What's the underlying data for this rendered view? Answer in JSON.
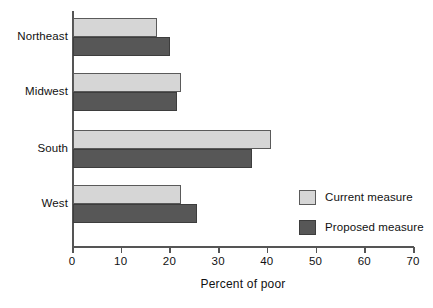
{
  "chart_data": {
    "type": "bar",
    "orientation": "horizontal",
    "title": "",
    "xlabel": "Percent of poor",
    "ylabel": "",
    "xlim": [
      0,
      70
    ],
    "xticks": [
      0,
      10,
      20,
      30,
      40,
      50,
      60,
      70
    ],
    "xtick_labels": [
      "0",
      "10",
      "20",
      "30",
      "40",
      "50",
      "60",
      "70"
    ],
    "grid": false,
    "legend_position": "inside-right",
    "categories": [
      "Northeast",
      "Midwest",
      "South",
      "West"
    ],
    "series": [
      {
        "name": "Current measure",
        "color": "#d6d6d6",
        "values": [
          17.1,
          22.0,
          40.5,
          22.0
        ]
      },
      {
        "name": "Proposed measure",
        "color": "#575757",
        "values": [
          19.8,
          21.2,
          36.6,
          25.3
        ]
      }
    ]
  },
  "legend": {
    "items": [
      {
        "label": "Current measure",
        "swatch": "light-gray-swatch"
      },
      {
        "label": "Proposed measure",
        "swatch": "dark-gray-swatch"
      }
    ]
  },
  "axis": {
    "x_title": "Percent of poor",
    "tick_labels": [
      "0",
      "10",
      "20",
      "30",
      "40",
      "50",
      "60",
      "70"
    ]
  },
  "categories": [
    "Northeast",
    "Midwest",
    "South",
    "West"
  ],
  "colors": {
    "current_measure": "#d6d6d6",
    "proposed_measure": "#575757",
    "axis": "#555555",
    "text": "#111111",
    "background": "#ffffff"
  }
}
